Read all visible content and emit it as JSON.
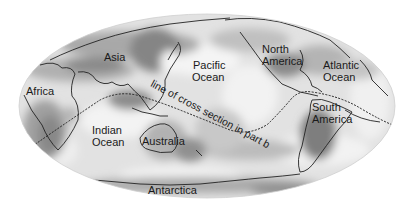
{
  "figure": {
    "type": "world-map",
    "projection": "elliptical (Mollweide-like)",
    "shading": "grayscale tomography",
    "colors": {
      "background": "#ffffff",
      "ocean_base": "#e4e4e4",
      "light_region": "#f2f2f2",
      "mid_region": "#b8b8b8",
      "dark_region": "#7c7c7c",
      "coastline": "#222222",
      "label": "#1a1a1a"
    }
  },
  "labels": {
    "asia": "Asia",
    "africa": "Africa",
    "pacific_line1": "Pacific",
    "pacific_line2": "Ocean",
    "north_america_line1": "North",
    "north_america_line2": "America",
    "atlantic_line1": "Atlantic",
    "atlantic_line2": "Ocean",
    "indian_line1": "Indian",
    "indian_line2": "Ocean",
    "australia": "Australia",
    "south_america_line1": "South",
    "south_america_line2": "America",
    "antarctica": "Antarctica",
    "cross_section": "line of cross section in part b"
  }
}
